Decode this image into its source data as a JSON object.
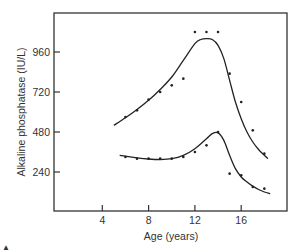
{
  "chart_data": {
    "type": "scatter",
    "title": "",
    "xlabel": "Age (years)",
    "ylabel": "Alkaline phosphatase (IU/L)",
    "xlim": [
      0,
      19
    ],
    "ylim": [
      0,
      1190
    ],
    "x_ticks": [
      4,
      8,
      12,
      16
    ],
    "x_tick_labels": [
      "4",
      "8",
      "12",
      "16"
    ],
    "y_ticks": [
      240,
      480,
      720,
      960
    ],
    "y_tick_labels": [
      "240",
      "480",
      "720",
      "960"
    ],
    "grid": false,
    "legend": null,
    "series": [
      {
        "name": "upper",
        "points": [
          [
            6,
            570
          ],
          [
            7,
            610
          ],
          [
            8,
            675
          ],
          [
            9,
            720
          ],
          [
            10,
            760
          ],
          [
            11,
            800
          ],
          [
            12,
            1080
          ],
          [
            13,
            1080
          ],
          [
            14,
            1080
          ],
          [
            15,
            830
          ],
          [
            16,
            660
          ],
          [
            17,
            490
          ],
          [
            18,
            350
          ]
        ],
        "fit_curve": [
          [
            5,
            520
          ],
          [
            6,
            565
          ],
          [
            7,
            615
          ],
          [
            8,
            670
          ],
          [
            9,
            735
          ],
          [
            10,
            810
          ],
          [
            11,
            910
          ],
          [
            12,
            1010
          ],
          [
            12.5,
            1035
          ],
          [
            13,
            1040
          ],
          [
            13.5,
            1035
          ],
          [
            14,
            1000
          ],
          [
            14.5,
            920
          ],
          [
            15,
            790
          ],
          [
            15.5,
            660
          ],
          [
            16,
            560
          ],
          [
            16.5,
            480
          ],
          [
            17,
            420
          ],
          [
            17.5,
            375
          ],
          [
            18,
            340
          ],
          [
            18.3,
            320
          ]
        ]
      },
      {
        "name": "lower",
        "points": [
          [
            6,
            330
          ],
          [
            7,
            320
          ],
          [
            8,
            320
          ],
          [
            9,
            320
          ],
          [
            10,
            320
          ],
          [
            11,
            330
          ],
          [
            12,
            360
          ],
          [
            13,
            400
          ],
          [
            14,
            480
          ],
          [
            15,
            230
          ],
          [
            16,
            220
          ],
          [
            17,
            150
          ],
          [
            18,
            140
          ]
        ],
        "fit_curve": [
          [
            5.5,
            340
          ],
          [
            6,
            335
          ],
          [
            7,
            325
          ],
          [
            8,
            318
          ],
          [
            9,
            315
          ],
          [
            10,
            320
          ],
          [
            11,
            340
          ],
          [
            12,
            380
          ],
          [
            13,
            440
          ],
          [
            13.5,
            470
          ],
          [
            14,
            475
          ],
          [
            14.5,
            430
          ],
          [
            15,
            340
          ],
          [
            15.5,
            260
          ],
          [
            16,
            210
          ],
          [
            16.5,
            180
          ],
          [
            17,
            155
          ],
          [
            17.5,
            135
          ],
          [
            18,
            120
          ],
          [
            18.5,
            110
          ]
        ]
      }
    ]
  },
  "footer": {
    "corner_mark": "▲"
  }
}
